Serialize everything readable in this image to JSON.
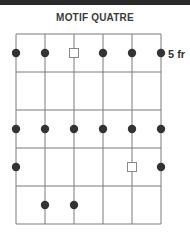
{
  "title": "MOTIF QUATRE",
  "fret_label": "5 fr",
  "colors": {
    "grid": "#7a7a7a",
    "dot": "#333333",
    "square": "#888888",
    "band": "#2a2a2a"
  },
  "grid": {
    "strings": 6,
    "frets": 5,
    "x": [
      16,
      45,
      74,
      103,
      132,
      161
    ],
    "y": [
      34,
      72,
      110,
      148,
      186,
      224
    ]
  },
  "markers": [
    {
      "type": "dot",
      "string": 1,
      "fret": 1
    },
    {
      "type": "dot",
      "string": 2,
      "fret": 1
    },
    {
      "type": "square",
      "string": 3,
      "fret": 1
    },
    {
      "type": "dot",
      "string": 4,
      "fret": 1
    },
    {
      "type": "dot",
      "string": 5,
      "fret": 1
    },
    {
      "type": "dot",
      "string": 6,
      "fret": 1
    },
    {
      "type": "dot",
      "string": 1,
      "fret": 3
    },
    {
      "type": "dot",
      "string": 2,
      "fret": 3
    },
    {
      "type": "dot",
      "string": 3,
      "fret": 3
    },
    {
      "type": "dot",
      "string": 4,
      "fret": 3
    },
    {
      "type": "dot",
      "string": 5,
      "fret": 3
    },
    {
      "type": "dot",
      "string": 6,
      "fret": 3
    },
    {
      "type": "dot",
      "string": 1,
      "fret": 4
    },
    {
      "type": "square",
      "string": 5,
      "fret": 4
    },
    {
      "type": "dot",
      "string": 6,
      "fret": 4
    },
    {
      "type": "dot",
      "string": 2,
      "fret": 5
    },
    {
      "type": "dot",
      "string": 3,
      "fret": 5
    }
  ]
}
